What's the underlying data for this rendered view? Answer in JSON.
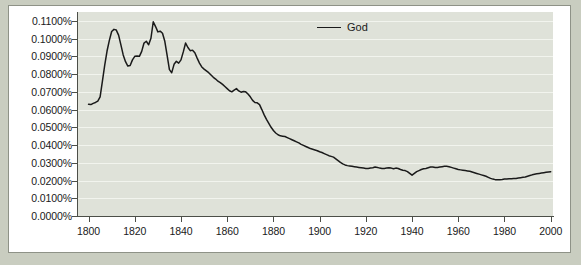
{
  "chart_data": {
    "type": "line",
    "title": "",
    "subtitle": "",
    "xlabel": "",
    "ylabel": "",
    "xlim": [
      1795,
      2001
    ],
    "ylim": [
      0.0,
      0.0115
    ],
    "grid": true,
    "legend_position": "top-center",
    "y_tick_labels": [
      "0.1100%",
      "0.1000%",
      "0.0900%",
      "0.0800%",
      "0.0700%",
      "0.0600%",
      "0.0500%",
      "0.0400%",
      "0.0300%",
      "0.0200%",
      "0.0100%",
      "0.0000%"
    ],
    "y_tick_values": [
      0.011,
      0.01,
      0.009,
      0.008,
      0.007,
      0.006,
      0.005,
      0.004,
      0.003,
      0.002,
      0.001,
      0.0
    ],
    "x_tick_labels": [
      "1800",
      "1820",
      "1840",
      "1860",
      "1880",
      "1900",
      "1920",
      "1940",
      "1960",
      "1980",
      "2000"
    ],
    "x_tick_values": [
      1800,
      1820,
      1840,
      1860,
      1880,
      1900,
      1920,
      1940,
      1960,
      1980,
      2000
    ],
    "series": [
      {
        "name": "God",
        "color": "#1a1a1a",
        "x": [
          1800,
          1801,
          1802,
          1803,
          1804,
          1805,
          1806,
          1807,
          1808,
          1809,
          1810,
          1811,
          1812,
          1813,
          1814,
          1815,
          1816,
          1817,
          1818,
          1819,
          1820,
          1821,
          1822,
          1823,
          1824,
          1825,
          1826,
          1827,
          1828,
          1829,
          1830,
          1831,
          1832,
          1833,
          1834,
          1835,
          1836,
          1837,
          1838,
          1839,
          1840,
          1841,
          1842,
          1843,
          1844,
          1845,
          1846,
          1847,
          1848,
          1849,
          1850,
          1851,
          1852,
          1853,
          1854,
          1855,
          1856,
          1857,
          1858,
          1859,
          1860,
          1861,
          1862,
          1863,
          1864,
          1865,
          1866,
          1867,
          1868,
          1869,
          1870,
          1871,
          1872,
          1873,
          1874,
          1875,
          1876,
          1877,
          1878,
          1879,
          1880,
          1881,
          1882,
          1883,
          1884,
          1885,
          1886,
          1887,
          1888,
          1889,
          1890,
          1891,
          1892,
          1893,
          1894,
          1895,
          1896,
          1897,
          1898,
          1899,
          1900,
          1901,
          1902,
          1903,
          1904,
          1905,
          1906,
          1907,
          1908,
          1909,
          1910,
          1911,
          1912,
          1913,
          1914,
          1915,
          1916,
          1917,
          1918,
          1919,
          1920,
          1921,
          1922,
          1923,
          1924,
          1925,
          1926,
          1927,
          1928,
          1929,
          1930,
          1931,
          1932,
          1933,
          1934,
          1935,
          1936,
          1937,
          1938,
          1939,
          1940,
          1941,
          1942,
          1943,
          1944,
          1945,
          1946,
          1947,
          1948,
          1949,
          1950,
          1951,
          1952,
          1953,
          1954,
          1955,
          1956,
          1957,
          1958,
          1959,
          1960,
          1961,
          1962,
          1963,
          1964,
          1965,
          1966,
          1967,
          1968,
          1969,
          1970,
          1971,
          1972,
          1973,
          1974,
          1975,
          1976,
          1977,
          1978,
          1979,
          1980,
          1981,
          1982,
          1983,
          1984,
          1985,
          1986,
          1987,
          1988,
          1989,
          1990,
          1991,
          1992,
          1993,
          1994,
          1995,
          1996,
          1997,
          1998,
          1999,
          2000
        ],
        "y": [
          0.0063,
          0.00628,
          0.00635,
          0.0064,
          0.00648,
          0.00672,
          0.0076,
          0.0085,
          0.0093,
          0.0099,
          0.0104,
          0.01052,
          0.01048,
          0.0102,
          0.00965,
          0.00908,
          0.0087,
          0.00845,
          0.00848,
          0.0088,
          0.009,
          0.00902,
          0.009,
          0.00928,
          0.00975,
          0.00985,
          0.00965,
          0.01002,
          0.01095,
          0.01068,
          0.01038,
          0.01042,
          0.0103,
          0.00985,
          0.00905,
          0.00825,
          0.00808,
          0.00855,
          0.00872,
          0.00862,
          0.0088,
          0.00925,
          0.00975,
          0.0095,
          0.00932,
          0.00935,
          0.0092,
          0.0089,
          0.00862,
          0.0084,
          0.00828,
          0.00818,
          0.00808,
          0.00795,
          0.00782,
          0.00772,
          0.0076,
          0.00752,
          0.00742,
          0.0073,
          0.00718,
          0.00706,
          0.007,
          0.0071,
          0.00718,
          0.00705,
          0.00698,
          0.00702,
          0.007,
          0.00688,
          0.00672,
          0.00652,
          0.0064,
          0.00638,
          0.00628,
          0.006,
          0.0057,
          0.00545,
          0.00522,
          0.005,
          0.00482,
          0.00468,
          0.00458,
          0.00452,
          0.0045,
          0.00448,
          0.00442,
          0.00436,
          0.0043,
          0.00424,
          0.00418,
          0.00412,
          0.00404,
          0.00398,
          0.00392,
          0.00386,
          0.0038,
          0.00376,
          0.00372,
          0.00368,
          0.00362,
          0.00358,
          0.00352,
          0.00346,
          0.0034,
          0.00336,
          0.00332,
          0.00322,
          0.00312,
          0.00302,
          0.00294,
          0.00288,
          0.00284,
          0.00282,
          0.0028,
          0.00278,
          0.00276,
          0.00274,
          0.00272,
          0.0027,
          0.00268,
          0.00268,
          0.0027,
          0.00272,
          0.00276,
          0.00274,
          0.0027,
          0.00268,
          0.00268,
          0.0027,
          0.00272,
          0.0027,
          0.00266,
          0.0027,
          0.00268,
          0.00262,
          0.00258,
          0.00256,
          0.0025,
          0.0024,
          0.0023,
          0.0024,
          0.0025,
          0.00256,
          0.00262,
          0.00266,
          0.00268,
          0.00272,
          0.00276,
          0.00276,
          0.00274,
          0.00274,
          0.00276,
          0.00278,
          0.0028,
          0.0028,
          0.00278,
          0.00274,
          0.0027,
          0.00266,
          0.00262,
          0.0026,
          0.00258,
          0.00256,
          0.00254,
          0.00252,
          0.00248,
          0.00244,
          0.0024,
          0.00236,
          0.00232,
          0.00228,
          0.00224,
          0.00218,
          0.00212,
          0.00208,
          0.00205,
          0.00204,
          0.00205,
          0.00206,
          0.00208,
          0.00209,
          0.0021,
          0.0021,
          0.00211,
          0.00212,
          0.00214,
          0.00216,
          0.00218,
          0.0022,
          0.00224,
          0.00228,
          0.00232,
          0.00235,
          0.00238,
          0.0024,
          0.00242,
          0.00244,
          0.00246,
          0.00248,
          0.0025
        ]
      }
    ],
    "legend": [
      {
        "label": "God",
        "color": "#1a1a1a"
      }
    ],
    "colors": {
      "plot_background": "#dfe2d9",
      "panel_background": "#ffffff",
      "outer_background": "#c9cdc0",
      "gridline": "#f2f4ee",
      "axis": "#4c4f48",
      "text": "#1a1a1a"
    }
  }
}
